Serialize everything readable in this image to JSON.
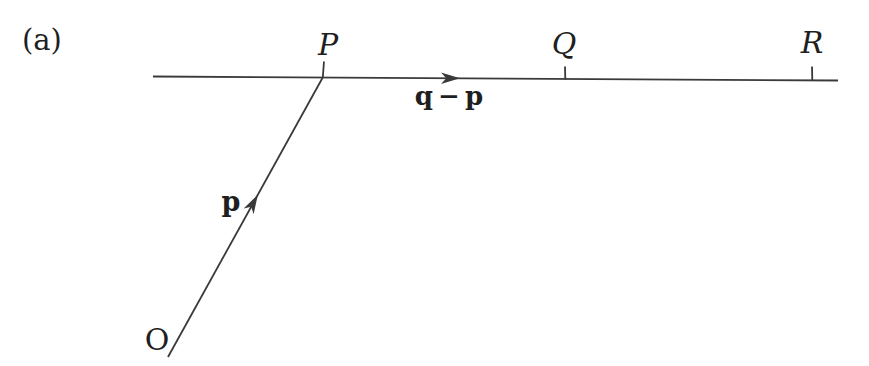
{
  "figure": {
    "panel_label": "(a)",
    "origin": {
      "label": "O"
    },
    "points": [
      {
        "label": "P"
      },
      {
        "label": "Q"
      },
      {
        "label": "R"
      }
    ],
    "vectors": [
      {
        "label": "p"
      },
      {
        "label": "q − p"
      }
    ],
    "colors": {
      "background": "#ffffff",
      "line": "#3a3a3a",
      "text": "#1f1f1f"
    }
  }
}
